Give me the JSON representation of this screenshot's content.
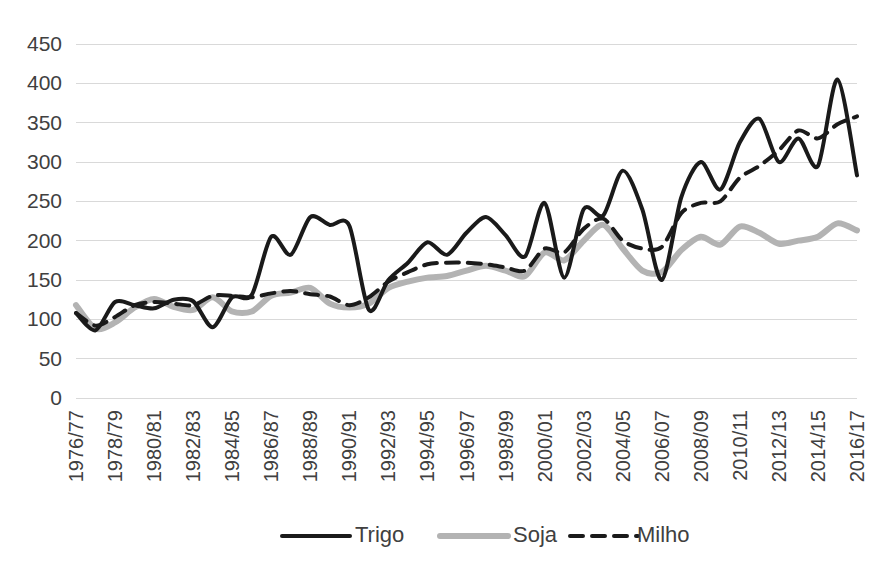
{
  "chart_data": {
    "type": "line",
    "title": "",
    "subtitle": "",
    "xlabel": "",
    "ylabel": "",
    "ylim": [
      0,
      450
    ],
    "yticks": [
      0,
      50,
      100,
      150,
      200,
      250,
      300,
      350,
      400,
      450
    ],
    "grid": true,
    "legend_position": "bottom",
    "x": [
      "1976/77",
      "1977/78",
      "1978/79",
      "1979/80",
      "1980/81",
      "1981/82",
      "1982/83",
      "1983/84",
      "1984/85",
      "1985/86",
      "1986/87",
      "1987/88",
      "1988/89",
      "1989/90",
      "1990/91",
      "1991/92",
      "1992/93",
      "1993/94",
      "1994/95",
      "1995/96",
      "1996/97",
      "1997/98",
      "1998/99",
      "1999/00",
      "2000/01",
      "2001/02",
      "2002/03",
      "2003/04",
      "2004/05",
      "2005/06",
      "2006/07",
      "2007/08",
      "2008/09",
      "2009/10",
      "2010/11",
      "2011/12",
      "2012/13",
      "2013/14",
      "2014/15",
      "2015/16",
      "2016/17"
    ],
    "xticklabels": [
      "1976/77",
      "1978/79",
      "1980/81",
      "1982/83",
      "1984/85",
      "1986/87",
      "1988/89",
      "1990/91",
      "1992/93",
      "1994/95",
      "1996/97",
      "1998/99",
      "2000/01",
      "2002/03",
      "2004/05",
      "2006/07",
      "2008/09",
      "2010/11",
      "2012/13",
      "2014/15",
      "2016/17"
    ],
    "series": [
      {
        "name": "Trigo",
        "color": "#1a1a1a",
        "style": "solid",
        "width": 4,
        "values": [
          108,
          86,
          122,
          118,
          114,
          125,
          123,
          90,
          128,
          131,
          205,
          182,
          230,
          220,
          219,
          112,
          150,
          172,
          198,
          182,
          210,
          230,
          207,
          180,
          248,
          153,
          240,
          232,
          289,
          240,
          150,
          255,
          300,
          265,
          325,
          355,
          300,
          330,
          295,
          405,
          283
        ]
      },
      {
        "name": "Soja",
        "color": "#b3b3b3",
        "style": "solid",
        "width": 6,
        "values": [
          118,
          88,
          96,
          115,
          126,
          116,
          112,
          128,
          110,
          110,
          130,
          134,
          140,
          120,
          115,
          120,
          140,
          148,
          153,
          155,
          162,
          168,
          162,
          155,
          185,
          175,
          200,
          220,
          190,
          162,
          160,
          188,
          205,
          195,
          218,
          210,
          196,
          200,
          205,
          222,
          213
        ]
      },
      {
        "name": "Milho",
        "color": "#1a1a1a",
        "style": "dashed",
        "width": 4,
        "values": [
          108,
          92,
          103,
          118,
          122,
          120,
          118,
          130,
          130,
          128,
          133,
          136,
          132,
          129,
          118,
          128,
          148,
          160,
          170,
          172,
          172,
          170,
          166,
          162,
          190,
          185,
          215,
          228,
          200,
          190,
          192,
          235,
          248,
          250,
          280,
          295,
          315,
          340,
          330,
          348,
          358
        ]
      }
    ]
  },
  "legend": {
    "items": [
      {
        "label": "Trigo"
      },
      {
        "label": "Soja"
      },
      {
        "label": "Milho"
      }
    ]
  }
}
